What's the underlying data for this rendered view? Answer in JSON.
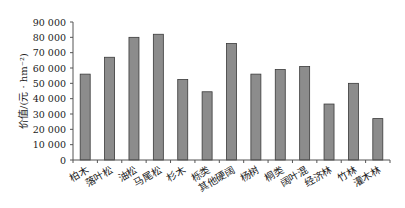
{
  "chart_data": {
    "type": "bar",
    "title": "",
    "xlabel": "",
    "ylabel": "价值/(元 · hm⁻²)",
    "ylim": [
      0,
      90000
    ],
    "yticks": [
      0,
      10000,
      20000,
      30000,
      40000,
      50000,
      60000,
      70000,
      80000,
      90000
    ],
    "ytick_labels": [
      "0",
      "10 000",
      "20 000",
      "30 000",
      "40 000",
      "50 000",
      "60 000",
      "70 000",
      "80 000",
      "90 000"
    ],
    "grid": false,
    "legend": null,
    "categories": [
      "柏木",
      "落叶松",
      "油松",
      "马尾松",
      "杉木",
      "栎类",
      "其他硬阔",
      "杨树",
      "桐类",
      "阔叶混",
      "经济林",
      "竹林",
      "灌木林"
    ],
    "values": [
      56000,
      67000,
      80000,
      82000,
      52500,
      44500,
      76000,
      56000,
      59000,
      61000,
      36500,
      50000,
      27000
    ],
    "colors": {
      "bar_fill": "#8c8c8c",
      "bar_stroke": "#3a3a3a",
      "axis": "#555555"
    }
  }
}
